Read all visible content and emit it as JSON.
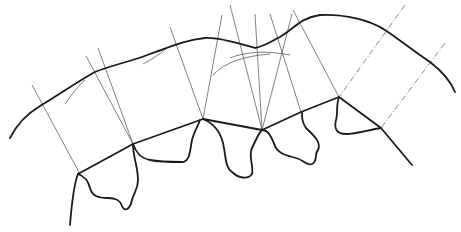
{
  "diagram": {
    "title": "",
    "colors": {
      "background": "#ffffff",
      "main_stroke": "#1a1a1a",
      "construction_stroke": "#4a4a4a"
    },
    "outer_curve": "M10,138 C18,122 30,112 40,106 C60,94 80,80 95,72 C115,64 130,62 150,54 C170,47 185,40 205,38 C220,37 240,44 255,48 C265,46 270,42 280,37 C295,28 300,18 320,15 C345,14 370,20 385,30 C400,40 415,52 430,62 C443,72 451,82 455,92",
    "joint_line": "M78,174 L133,144 L203,119 L262,130 L301,112 L339,97 L381,128",
    "lobes": [
      "M78,174 C84,176 88,180 90,188 C92,196 98,198 108,198 C116,198 120,200 122,206 C124,212 130,210 132,200 C134,192 138,190 138,180 C138,166 133,158 133,144",
      "M133,144 C136,152 140,158 150,160 C160,162 172,162 182,162 C190,162 190,150 192,140 C194,132 198,126 200,120",
      "M203,119 C215,124 222,134 224,148 C226,160 226,168 232,172 C238,178 248,180 252,174 C254,166 248,156 252,148 C256,140 258,134 262,130",
      "M262,130 C270,130 272,140 276,148 C280,154 288,156 296,158 C304,160 306,166 312,164 C318,162 314,154 318,150 C322,142 312,134 306,128 C302,122 302,118 302,113",
      "M339,97 C336,104 338,114 336,120 C334,128 336,134 346,134 C356,134 368,130 381,128"
    ],
    "tails": [
      "M78,174 C74,184 72,200 70,225",
      "M381,128 L412,165"
    ],
    "arcs": [
      "M65,104 C72,94 78,86 85,80",
      "M143,64 C150,60 158,56 168,47",
      "M213,75 C225,62 245,56 270,54",
      "M230,58 C245,52 265,50 290,55"
    ],
    "construction_lines": [
      {
        "x1": 32,
        "y1": 85,
        "x2": 80,
        "y2": 174
      },
      {
        "x1": 86,
        "y1": 56,
        "x2": 133,
        "y2": 144
      },
      {
        "x1": 98,
        "y1": 48,
        "x2": 133,
        "y2": 144
      },
      {
        "x1": 170,
        "y1": 27,
        "x2": 203,
        "y2": 119
      },
      {
        "x1": 222,
        "y1": 15,
        "x2": 203,
        "y2": 119
      },
      {
        "x1": 230,
        "y1": 5,
        "x2": 262,
        "y2": 130
      },
      {
        "x1": 255,
        "y1": 14,
        "x2": 262,
        "y2": 130
      },
      {
        "x1": 270,
        "y1": 14,
        "x2": 301,
        "y2": 112
      },
      {
        "x1": 292,
        "y1": 14,
        "x2": 262,
        "y2": 130
      },
      {
        "x1": 293,
        "y1": 10,
        "x2": 339,
        "y2": 97
      }
    ],
    "dashed_lines": [
      {
        "x1": 405,
        "y1": 5,
        "x2": 339,
        "y2": 97
      },
      {
        "x1": 445,
        "y1": 43,
        "x2": 381,
        "y2": 128
      }
    ]
  }
}
